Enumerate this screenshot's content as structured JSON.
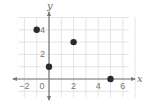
{
  "chart_data": {
    "type": "scatter",
    "title": "",
    "xlabel": "x",
    "ylabel": "y",
    "xlim": [
      -2.5,
      6.5
    ],
    "ylim": [
      -1.5,
      5
    ],
    "grid": true,
    "x_ticks": [
      "-2",
      "0",
      "2",
      "4",
      "6"
    ],
    "y_ticks": [
      "2",
      "4"
    ],
    "points": [
      {
        "x": -1,
        "y": 4
      },
      {
        "x": 2,
        "y": 3
      },
      {
        "x": 0,
        "y": 1
      },
      {
        "x": 5,
        "y": 0
      }
    ],
    "colors": {
      "point": "#2a2a2a",
      "axis": "#777777",
      "grid": "#dddddd"
    }
  }
}
